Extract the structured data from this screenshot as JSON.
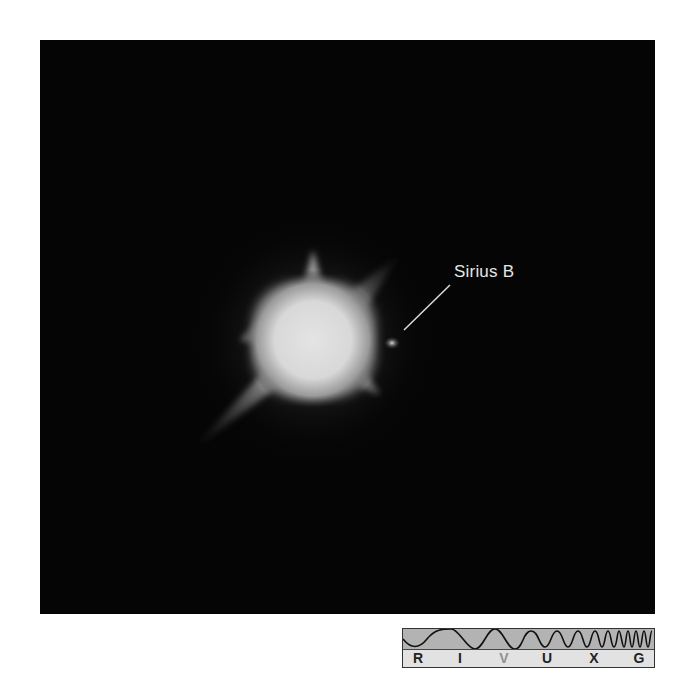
{
  "figure": {
    "annotation": "Sirius B",
    "background_color": "#050505"
  },
  "spectrum_bar": {
    "bands": [
      {
        "label": "R",
        "x": 15,
        "highlighted": false
      },
      {
        "label": "I",
        "x": 57,
        "highlighted": false
      },
      {
        "label": "V",
        "x": 101,
        "highlighted": true
      },
      {
        "label": "U",
        "x": 144,
        "highlighted": false
      },
      {
        "label": "X",
        "x": 191,
        "highlighted": false
      },
      {
        "label": "G",
        "x": 236,
        "highlighted": false
      }
    ],
    "wave_color": "#b3b3b3",
    "label_color": "#e2e2e2"
  }
}
